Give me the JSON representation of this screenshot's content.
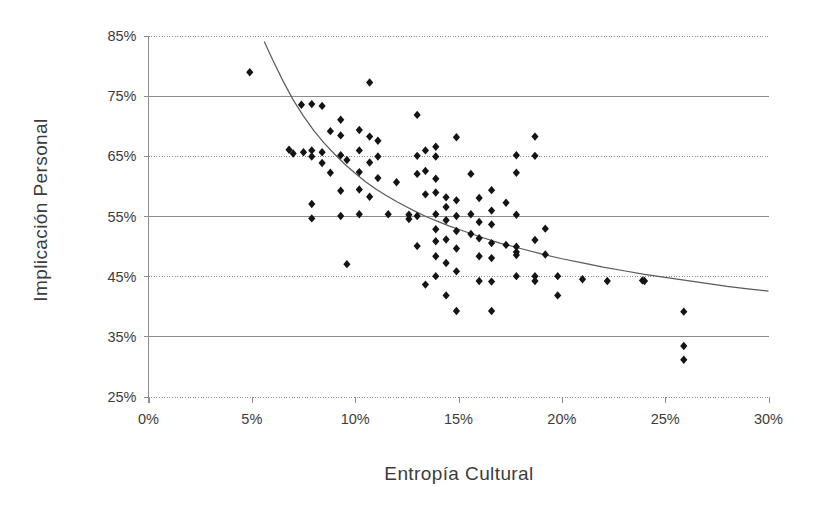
{
  "chart_data": {
    "type": "scatter",
    "title": "",
    "xlabel": "Entropía Cultural",
    "ylabel": "Implicación  Personal",
    "xlim": [
      0,
      30
    ],
    "ylim": [
      25,
      85
    ],
    "xtick_labels": [
      "0%",
      "5%",
      "10%",
      "15%",
      "20%",
      "25%",
      "30%"
    ],
    "xticks": [
      0,
      5,
      10,
      15,
      20,
      25,
      30
    ],
    "ytick_labels": [
      "25%",
      "35%",
      "45%",
      "55%",
      "65%",
      "75%",
      "85%"
    ],
    "yticks": [
      25,
      35,
      45,
      55,
      65,
      75,
      85
    ],
    "grid": true,
    "grid_axis": "y",
    "legend": "none",
    "marker": "diamond",
    "marker_color": "#141414",
    "trendline_color": "#5a5a5a",
    "trendline_type": "power-decay",
    "trendline": [
      [
        5.6,
        84.0
      ],
      [
        6.0,
        81.0
      ],
      [
        6.5,
        77.5
      ],
      [
        7.0,
        74.3
      ],
      [
        7.5,
        71.6
      ],
      [
        8.0,
        69.2
      ],
      [
        8.5,
        67.1
      ],
      [
        9.0,
        65.3
      ],
      [
        9.5,
        63.6
      ],
      [
        10.0,
        62.1
      ],
      [
        10.5,
        60.7
      ],
      [
        11.0,
        59.5
      ],
      [
        11.5,
        58.4
      ],
      [
        12.0,
        57.4
      ],
      [
        12.5,
        56.5
      ],
      [
        13.0,
        55.6
      ],
      [
        13.5,
        54.8
      ],
      [
        14.0,
        54.1
      ],
      [
        14.5,
        53.4
      ],
      [
        15.0,
        52.8
      ],
      [
        16.0,
        51.6
      ],
      [
        17.0,
        50.5
      ],
      [
        18.0,
        49.6
      ],
      [
        19.0,
        48.7
      ],
      [
        20.0,
        47.9
      ],
      [
        21.0,
        47.2
      ],
      [
        22.0,
        46.5
      ],
      [
        23.0,
        45.9
      ],
      [
        24.0,
        45.3
      ],
      [
        25.0,
        44.8
      ],
      [
        26.0,
        44.3
      ],
      [
        27.0,
        43.8
      ],
      [
        28.0,
        43.3
      ],
      [
        29.0,
        42.9
      ],
      [
        30.0,
        42.5
      ]
    ],
    "points": [
      [
        4.9,
        78.9
      ],
      [
        6.8,
        66.0
      ],
      [
        7.0,
        65.4
      ],
      [
        7.4,
        73.5
      ],
      [
        7.5,
        65.6
      ],
      [
        7.9,
        73.6
      ],
      [
        7.9,
        65.9
      ],
      [
        7.9,
        64.9
      ],
      [
        7.9,
        57.0
      ],
      [
        7.9,
        54.6
      ],
      [
        8.4,
        73.3
      ],
      [
        8.4,
        65.6
      ],
      [
        8.4,
        63.8
      ],
      [
        8.8,
        69.1
      ],
      [
        8.8,
        62.2
      ],
      [
        9.3,
        71.0
      ],
      [
        9.3,
        68.4
      ],
      [
        9.3,
        65.1
      ],
      [
        9.3,
        59.2
      ],
      [
        9.3,
        55.0
      ],
      [
        9.6,
        64.3
      ],
      [
        9.6,
        47.0
      ],
      [
        10.2,
        69.3
      ],
      [
        10.2,
        65.9
      ],
      [
        10.2,
        62.3
      ],
      [
        10.2,
        59.4
      ],
      [
        10.2,
        55.3
      ],
      [
        10.7,
        77.2
      ],
      [
        10.7,
        68.2
      ],
      [
        10.7,
        63.9
      ],
      [
        10.7,
        58.2
      ],
      [
        11.1,
        67.5
      ],
      [
        11.1,
        64.9
      ],
      [
        11.1,
        61.3
      ],
      [
        11.6,
        55.3
      ],
      [
        12.0,
        60.6
      ],
      [
        12.6,
        55.2
      ],
      [
        12.6,
        54.5
      ],
      [
        13.0,
        71.8
      ],
      [
        13.0,
        65.0
      ],
      [
        13.0,
        62.0
      ],
      [
        13.0,
        55.0
      ],
      [
        13.0,
        50.0
      ],
      [
        13.4,
        65.9
      ],
      [
        13.4,
        62.5
      ],
      [
        13.4,
        58.6
      ],
      [
        13.4,
        43.6
      ],
      [
        13.9,
        66.5
      ],
      [
        13.9,
        64.9
      ],
      [
        13.9,
        61.2
      ],
      [
        13.9,
        58.9
      ],
      [
        13.9,
        55.3
      ],
      [
        13.9,
        52.8
      ],
      [
        13.9,
        50.8
      ],
      [
        13.9,
        48.3
      ],
      [
        13.9,
        45.0
      ],
      [
        14.4,
        58.1
      ],
      [
        14.4,
        56.5
      ],
      [
        14.4,
        54.3
      ],
      [
        14.4,
        51.1
      ],
      [
        14.4,
        47.2
      ],
      [
        14.4,
        41.8
      ],
      [
        14.9,
        68.1
      ],
      [
        14.9,
        57.6
      ],
      [
        14.9,
        55.0
      ],
      [
        14.9,
        52.5
      ],
      [
        14.9,
        49.6
      ],
      [
        14.9,
        45.8
      ],
      [
        14.9,
        39.2
      ],
      [
        15.6,
        62.0
      ],
      [
        15.6,
        55.3
      ],
      [
        15.6,
        52.0
      ],
      [
        16.0,
        58.0
      ],
      [
        16.0,
        54.0
      ],
      [
        16.0,
        51.3
      ],
      [
        16.0,
        48.3
      ],
      [
        16.0,
        44.2
      ],
      [
        16.6,
        59.3
      ],
      [
        16.6,
        55.9
      ],
      [
        16.6,
        53.6
      ],
      [
        16.6,
        50.5
      ],
      [
        16.6,
        48.0
      ],
      [
        16.6,
        44.1
      ],
      [
        16.6,
        39.2
      ],
      [
        17.3,
        57.2
      ],
      [
        17.3,
        50.2
      ],
      [
        17.8,
        65.1
      ],
      [
        17.8,
        62.2
      ],
      [
        17.8,
        55.2
      ],
      [
        17.8,
        49.9
      ],
      [
        17.8,
        49.0
      ],
      [
        17.8,
        48.5
      ],
      [
        17.8,
        45.0
      ],
      [
        18.7,
        68.2
      ],
      [
        18.7,
        65.0
      ],
      [
        18.7,
        51.0
      ],
      [
        18.7,
        45.0
      ],
      [
        18.7,
        44.2
      ],
      [
        19.2,
        52.9
      ],
      [
        19.2,
        48.6
      ],
      [
        19.8,
        45.0
      ],
      [
        19.8,
        41.8
      ],
      [
        21.0,
        44.5
      ],
      [
        22.2,
        44.2
      ],
      [
        23.9,
        44.3
      ],
      [
        24.0,
        44.2
      ],
      [
        25.9,
        39.1
      ],
      [
        25.9,
        33.4
      ],
      [
        25.9,
        31.1
      ]
    ]
  }
}
